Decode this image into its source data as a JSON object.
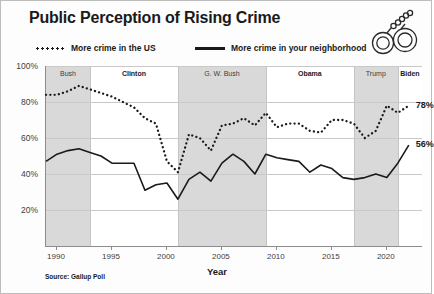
{
  "title": "Public Perception of Rising Crime",
  "source": "Source: Gallup Poll",
  "icon": "handcuffs-icon",
  "colors": {
    "ink": "#1a1a1a",
    "band": "#d9d9d9",
    "grid": "#c9c9c9",
    "axis": "#8c8c8c"
  },
  "legend": [
    {
      "label": "More crime in the US",
      "style": "dotted"
    },
    {
      "label": "More crime in your neighborhood",
      "style": "solid"
    }
  ],
  "bands": [
    {
      "label": "Bush",
      "start": 1989,
      "end": 1993,
      "shaded": true,
      "bold": false
    },
    {
      "label": "Clinton",
      "start": 1993,
      "end": 2001,
      "shaded": false,
      "bold": true
    },
    {
      "label": "G. W. Bush",
      "start": 2001,
      "end": 2009,
      "shaded": true,
      "bold": false
    },
    {
      "label": "Obama",
      "start": 2009,
      "end": 2017,
      "shaded": false,
      "bold": true
    },
    {
      "label": "Trump",
      "start": 2017,
      "end": 2021,
      "shaded": true,
      "bold": false
    },
    {
      "label": "Biden",
      "start": 2021,
      "end": 2023.2,
      "shaded": false,
      "bold": true
    }
  ],
  "end_labels": [
    {
      "text": "78%",
      "series": "us",
      "year": 2022,
      "value": 78
    },
    {
      "text": "56%",
      "series": "neighborhood",
      "year": 2022,
      "value": 56
    }
  ],
  "chart_data": {
    "type": "line",
    "title": "Public Perception of Rising Crime",
    "xlabel": "Year",
    "ylabel": "",
    "xlim": [
      1989,
      2023.2
    ],
    "ylim": [
      0,
      100
    ],
    "yticks": [
      "0%",
      "20%",
      "40%",
      "60%",
      "80%",
      "100%"
    ],
    "ytick_values": [
      0,
      20,
      40,
      60,
      80,
      100
    ],
    "xticks": [
      1990,
      1995,
      2000,
      2005,
      2010,
      2015,
      2020
    ],
    "grid": "horizontal",
    "legend_position": "top",
    "annotations": [
      "78%",
      "56%"
    ],
    "series": [
      {
        "name": "More crime in the US",
        "style": "dotted",
        "x": [
          1989,
          1990,
          1991,
          1992,
          1993,
          1994,
          1995,
          1996,
          1997,
          1998,
          1999,
          2000,
          2001,
          2002,
          2003,
          2004,
          2005,
          2006,
          2007,
          2008,
          2009,
          2010,
          2011,
          2012,
          2013,
          2014,
          2015,
          2016,
          2017,
          2018,
          2019,
          2020,
          2021,
          2022
        ],
        "values": [
          84,
          84,
          86,
          89,
          87,
          85,
          83,
          80,
          77,
          71,
          68,
          47,
          41,
          62,
          60,
          53,
          67,
          68,
          71,
          67,
          74,
          66,
          68,
          68,
          64,
          63,
          70,
          70,
          68,
          60,
          64,
          78,
          74,
          78
        ]
      },
      {
        "name": "More crime in your neighborhood",
        "style": "solid",
        "x": [
          1989,
          1990,
          1991,
          1992,
          1993,
          1994,
          1995,
          1996,
          1997,
          1998,
          1999,
          2000,
          2001,
          2002,
          2003,
          2004,
          2005,
          2006,
          2007,
          2008,
          2009,
          2010,
          2011,
          2012,
          2013,
          2014,
          2015,
          2016,
          2017,
          2018,
          2019,
          2020,
          2021,
          2022
        ],
        "values": [
          47,
          51,
          53,
          54,
          52,
          50,
          46,
          46,
          46,
          31,
          34,
          35,
          26,
          37,
          41,
          36,
          46,
          51,
          47,
          40,
          51,
          49,
          48,
          47,
          41,
          45,
          43,
          38,
          37,
          38,
          40,
          38,
          46,
          56
        ]
      }
    ]
  }
}
